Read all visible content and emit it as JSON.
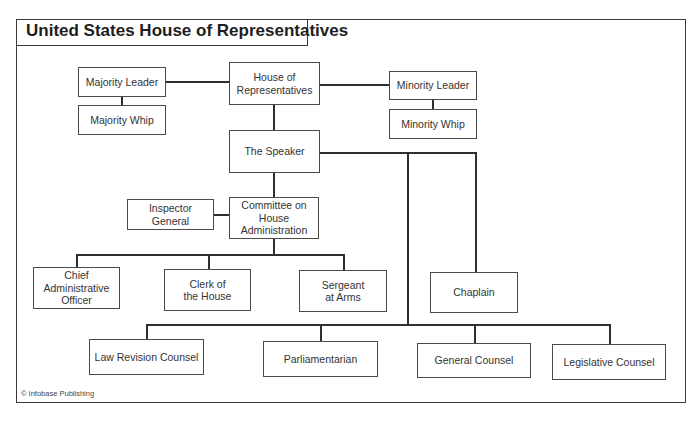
{
  "title": "United States House of Representatives",
  "credit": "© Infobase Publishing",
  "nodes": {
    "house": "House of Representatives",
    "majority_leader": "Majority Leader",
    "majority_whip": "Majority Whip",
    "minority_leader": "Minority Leader",
    "minority_whip": "Minority Whip",
    "speaker": "The Speaker",
    "inspector_general": "Inspector General",
    "committee": "Committee on House Administration",
    "chief_admin": "Chief Administrative Officer",
    "clerk": "Clerk of the House",
    "sergeant": "Sergeant at Arms",
    "chaplain": "Chaplain",
    "law_revision": "Law Revision Counsel",
    "parliamentarian": "Parliamentarian",
    "general_counsel": "General Counsel",
    "legislative_counsel": "Legislative Counsel"
  },
  "edges": [
    [
      "house",
      "majority_leader"
    ],
    [
      "house",
      "minority_leader"
    ],
    [
      "majority_leader",
      "majority_whip"
    ],
    [
      "minority_leader",
      "minority_whip"
    ],
    [
      "house",
      "speaker"
    ],
    [
      "speaker",
      "committee"
    ],
    [
      "speaker",
      "chaplain"
    ],
    [
      "speaker",
      "law_revision"
    ],
    [
      "speaker",
      "parliamentarian"
    ],
    [
      "speaker",
      "general_counsel"
    ],
    [
      "speaker",
      "legislative_counsel"
    ],
    [
      "committee",
      "inspector_general"
    ],
    [
      "committee",
      "chief_admin"
    ],
    [
      "committee",
      "clerk"
    ],
    [
      "committee",
      "sergeant"
    ]
  ]
}
